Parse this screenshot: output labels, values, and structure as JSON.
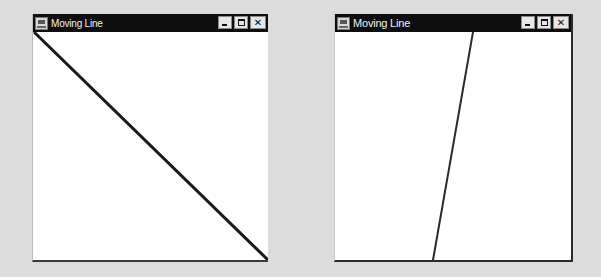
{
  "windows": [
    {
      "title": "Moving Line",
      "icon": "java-cup-icon",
      "buttons": {
        "minimize": "",
        "maximize": "",
        "close": "✕"
      },
      "line": {
        "x1": 2,
        "y1": 1,
        "x2": 234,
        "y2": 227,
        "color": "#1a1a1a",
        "width": 3
      }
    },
    {
      "title": "Moving Line",
      "icon": "java-cup-icon",
      "buttons": {
        "minimize": "",
        "maximize": "",
        "close": "✕"
      },
      "line": {
        "x1": 138,
        "y1": 0,
        "x2": 98,
        "y2": 228,
        "color": "#2a2a2a",
        "width": 2
      }
    }
  ],
  "colors": {
    "desktop": "#dcdcdc",
    "titlebar": "#0e0e0e",
    "client": "#ffffff"
  }
}
